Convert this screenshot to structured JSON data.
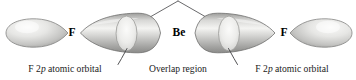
{
  "figure": {
    "background_color": "#ffffff",
    "width": 356,
    "height": 80
  },
  "atoms": [
    {
      "id": "fluorine-left",
      "label": "F",
      "x": 72,
      "y": 33
    },
    {
      "id": "beryllium",
      "label": "Be",
      "x": 179,
      "y": 33
    },
    {
      "id": "fluorine-right",
      "label": "F",
      "x": 284,
      "y": 33
    }
  ],
  "orbitals": [
    {
      "id": "f-2p-lobe-left",
      "kind": "teardrop",
      "direction": "point-right"
    },
    {
      "id": "be-sp-orbital-left",
      "kind": "lens"
    },
    {
      "id": "be-sp-orbital-right",
      "kind": "lens"
    },
    {
      "id": "f-2p-lobe-right",
      "kind": "teardrop",
      "direction": "point-left"
    }
  ],
  "overlap_regions": [
    {
      "id": "overlap-left",
      "cx": 126,
      "cy": 34,
      "electron_count": 2
    },
    {
      "id": "overlap-right",
      "cx": 229,
      "cy": 34,
      "electron_count": 2
    }
  ],
  "captions": {
    "left_orbital": {
      "prefix": "F 2",
      "italic": "p",
      "suffix": " atomic orbital",
      "x": 65,
      "y": 69
    },
    "overlap": {
      "text": "Overlap region",
      "x": 178,
      "y": 69
    },
    "right_orbital": {
      "prefix": "F 2",
      "italic": "p",
      "suffix": " atomic orbital",
      "x": 292,
      "y": 69
    }
  },
  "leader_lines": {
    "top_apex": {
      "x": 178,
      "y": 1
    },
    "left_top_end": {
      "x": 140,
      "y": 22
    },
    "right_top_end": {
      "x": 216,
      "y": 22
    },
    "bottom_left": {
      "from_x": 127,
      "from_y": 47,
      "to_x": 118,
      "to_y": 63
    },
    "bottom_right": {
      "from_x": 228,
      "from_y": 47,
      "to_x": 238,
      "to_y": 63
    }
  },
  "colors": {
    "orbital_light": "#f2f2f0",
    "orbital_mid": "#c9c9c7",
    "orbital_dark": "#8d8d8b",
    "outline": "#6e6e6c",
    "electron_dot": "#111111",
    "leader_line": "#4a4a4a",
    "text": "#111111"
  }
}
